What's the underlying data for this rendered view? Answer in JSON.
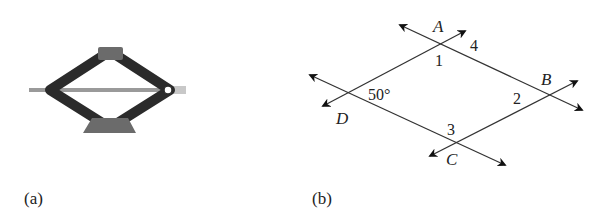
{
  "figure": {
    "panel_a": {
      "caption": "(a)",
      "subject": "scissor-car-jack",
      "colors": {
        "arms": "#2b2b2b",
        "rod": "#9a9a9a",
        "pads": "#6b6b6b"
      }
    },
    "panel_b": {
      "caption": "(b)",
      "points": {
        "A": "A",
        "B": "B",
        "C": "C",
        "D": "D"
      },
      "angles": {
        "angle_1": "1",
        "angle_2": "2",
        "angle_3": "3",
        "angle_4": "4",
        "angle_D": "50°"
      },
      "line_color": "#333333"
    }
  }
}
